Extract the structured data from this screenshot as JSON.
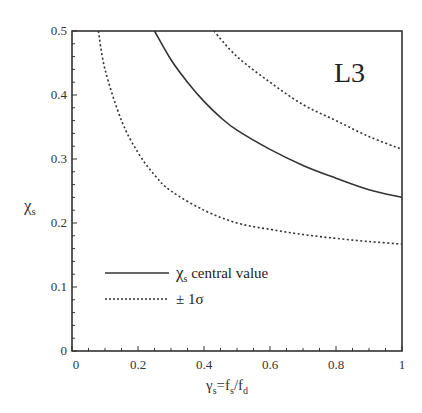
{
  "chart_data": {
    "type": "line",
    "title": "",
    "panel_label": "L3",
    "xlabel": "γs=fs/fd",
    "xlabel_parts": {
      "gamma": "γ",
      "gamma_sub": "s",
      "eq": "=f",
      "f_sub1": "s",
      "slash": "/f",
      "f_sub2": "d"
    },
    "ylabel": "χs",
    "ylabel_parts": {
      "chi": "χ",
      "chi_sub": "s"
    },
    "xlim": [
      0,
      1
    ],
    "ylim": [
      0,
      0.5
    ],
    "xticks": [
      0,
      0.2,
      0.4,
      0.6,
      0.8,
      1
    ],
    "xtick_labels": [
      "0",
      "0.2",
      "0.4",
      "0.6",
      "0.8",
      "1"
    ],
    "yticks": [
      0,
      0.1,
      0.2,
      0.3,
      0.4,
      0.5
    ],
    "ytick_labels": [
      "0",
      "0.1",
      "0.2",
      "0.3",
      "0.4",
      "0.5"
    ],
    "grid": false,
    "legend_position": "lower left",
    "series": [
      {
        "name": "χs central value",
        "style": "solid",
        "x": [
          0.25,
          0.3,
          0.35,
          0.4,
          0.45,
          0.5,
          0.6,
          0.7,
          0.8,
          0.9,
          1.0
        ],
        "y": [
          0.5,
          0.455,
          0.42,
          0.39,
          0.365,
          0.345,
          0.315,
          0.29,
          0.27,
          0.252,
          0.24
        ]
      },
      {
        "name": "+1σ",
        "style": "dotted",
        "x": [
          0.43,
          0.5,
          0.6,
          0.7,
          0.8,
          0.9,
          1.0
        ],
        "y": [
          0.5,
          0.46,
          0.42,
          0.385,
          0.36,
          0.335,
          0.315
        ]
      },
      {
        "name": "-1σ",
        "style": "dotted",
        "x": [
          0.08,
          0.1,
          0.15,
          0.2,
          0.25,
          0.3,
          0.4,
          0.5,
          0.6,
          0.7,
          0.8,
          0.9,
          1.0
        ],
        "y": [
          0.5,
          0.44,
          0.36,
          0.31,
          0.275,
          0.25,
          0.22,
          0.2,
          0.19,
          0.182,
          0.176,
          0.171,
          0.167
        ]
      }
    ],
    "legend": [
      {
        "label_main": "χ",
        "label_sub": "s",
        "label_rest": " central value",
        "style": "solid"
      },
      {
        "label_main": "± 1σ",
        "label_sub": "",
        "label_rest": "",
        "style": "dotted"
      }
    ]
  }
}
